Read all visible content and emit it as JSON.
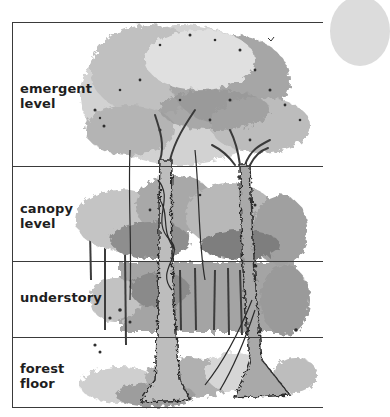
{
  "diagram": {
    "layers": [
      {
        "id": "emergent",
        "label": "emergent\nlevel",
        "top": 22,
        "bottom": 166
      },
      {
        "id": "canopy",
        "label": "canopy\nlevel",
        "top": 166,
        "bottom": 261
      },
      {
        "id": "understory",
        "label": "understory",
        "top": 261,
        "bottom": 337
      },
      {
        "id": "forest-floor",
        "label": "forest\nfloor",
        "top": 337,
        "bottom": 407
      }
    ],
    "colors": {
      "line": "#3a3a3a",
      "text": "#1e1e1e",
      "foliage_light": "#c8c8c8",
      "foliage_mid": "#9a9a9a",
      "foliage_dark": "#4a4a4a",
      "corner_circle": "#dcdcdc"
    }
  }
}
